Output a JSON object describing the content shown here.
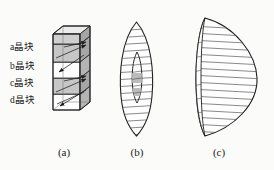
{
  "figure": {
    "background_color": "#fbfbfa",
    "line_color": "#2b2b2b",
    "hatch_color": "#4a4a4a",
    "shade_color": "#b9b9b9",
    "face_color": "#c9c9c9",
    "top_face_color": "#e3e3e3",
    "side_face_color": "#a8a8a8"
  },
  "panel_a": {
    "name": "layered-crystal-block",
    "slab_labels": [
      {
        "id": "a",
        "text": "a晶块"
      },
      {
        "id": "b",
        "text": "b晶块"
      },
      {
        "id": "c",
        "text": "c晶块"
      },
      {
        "id": "d",
        "text": "d晶块"
      }
    ],
    "caption": "(a)"
  },
  "panel_b": {
    "name": "narrow-lens-cross-section",
    "caption": "(b)",
    "hatch_line_count": 17,
    "has_inner_lens": true,
    "inner_lens_shaded": true
  },
  "panel_c": {
    "name": "plano-convex-lens-cross-section",
    "caption": "(c)",
    "hatch_line_count": 17,
    "has_edge_sliver": true
  },
  "captions": {
    "a": "(a)",
    "b": "(b)",
    "c": "(c)"
  }
}
